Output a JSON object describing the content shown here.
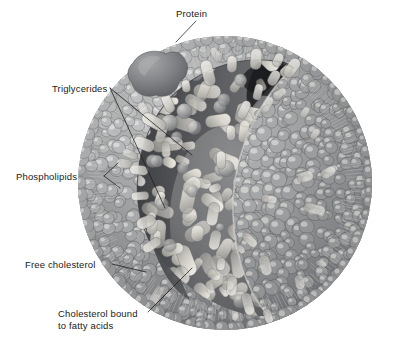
{
  "figure": {
    "background_color": "#ffffff",
    "width": 407,
    "height": 361
  },
  "palette": {
    "background": "#ffffff",
    "label_text": "#1a1a1a",
    "leader_line": "#1b1b1b",
    "shell_dark": "#6f7072",
    "shell_mid": "#8d8e90",
    "shell_light": "#b9bab9",
    "head_highlight": "#d9dad7",
    "cholesterol_capsule": "#e8e8e4",
    "core_background": "#7d7e80",
    "core_shadow": "#4a4b4d",
    "core_deep_shadow": "#2a2b2d",
    "triglyceride_light": "#eceae4",
    "triglyceride_mid": "#cfcdc6",
    "protein_dark": "#77787a",
    "protein_light": "#9fa0a1",
    "tail_line": "#cfd0ce"
  },
  "labels": [
    {
      "id": "protein",
      "name": "label-protein",
      "text": "Protein",
      "x": 176,
      "y": 17,
      "anchor": "start"
    },
    {
      "id": "triglycerides",
      "name": "label-triglycerides",
      "text": "Triglycerides",
      "x": 52,
      "y": 92,
      "anchor": "start"
    },
    {
      "id": "phospholipids",
      "name": "label-phospholipids",
      "text": "Phospholipids",
      "x": 16,
      "y": 180,
      "anchor": "start"
    },
    {
      "id": "free-cholesterol",
      "name": "label-free-cholesterol",
      "text": "Free cholesterol",
      "x": 25,
      "y": 268,
      "anchor": "start"
    },
    {
      "id": "cholesterol-bound-1",
      "name": "label-cholesterol-bound-line1",
      "text": "Cholesterol bound",
      "x": 58,
      "y": 317,
      "anchor": "start"
    },
    {
      "id": "cholesterol-bound-2",
      "name": "label-cholesterol-bound-line2",
      "text": "to fatty acids",
      "x": 58,
      "y": 329,
      "anchor": "start"
    }
  ],
  "structures": [
    {
      "id": "outer-shell",
      "name": "lipoprotein-outer-shell",
      "description": "Spherical monolayer surface of packed phospholipid head groups"
    },
    {
      "id": "cutaway-core",
      "name": "lipoprotein-core-cutaway",
      "description": "Lens-shaped cutaway revealing the hydrophobic lipid core"
    },
    {
      "id": "protein-blob",
      "name": "apolipoprotein-blob",
      "description": "Embedded apolipoprotein on the particle surface"
    },
    {
      "id": "triglyceride-field",
      "name": "triglyceride-core-lipids",
      "description": "Capsule-shaped triglyceride molecules filling the core"
    },
    {
      "id": "cholesterol-capsules",
      "name": "cholesterol-ester-capsules",
      "description": "Elongated light capsules representing cholesterol esters in the shell"
    },
    {
      "id": "phospholipid-tails",
      "name": "phospholipid-tail-lines",
      "description": "Radiating fatty acid tails beneath the surface heads"
    }
  ]
}
